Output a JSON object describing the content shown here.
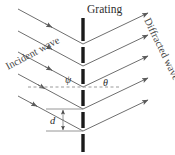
{
  "figure": {
    "name": "diffraction-grating-diagram",
    "width": 175,
    "height": 155,
    "background": "#ffffff"
  },
  "labels": {
    "grating": "Grating",
    "incident_wave": "Incident wave",
    "diffracted_wave": "Diffracted wave",
    "angle_incident": "ψ",
    "angle_diffracted": "θ",
    "spacing": "d"
  },
  "colors": {
    "grating_bar": "#1a1a1a",
    "ray": "#6f6f6f",
    "arrowhead": "#5a5a5a",
    "dashed_line": "#9a9a9a",
    "dimension_line": "#8a8a8a",
    "text": "#3a3a3a"
  },
  "geometry": {
    "grating_x": 83,
    "slit_nodes_y": [
      44,
      66,
      87,
      109,
      131
    ],
    "grating_bars": [
      {
        "y1": 18,
        "y2": 41
      },
      {
        "y1": 47,
        "y2": 63
      },
      {
        "y1": 69,
        "y2": 84
      },
      {
        "y1": 90,
        "y2": 106
      },
      {
        "y1": 112,
        "y2": 128
      },
      {
        "y1": 134,
        "y2": 152
      }
    ],
    "incident_rays": [
      {
        "x1": 18,
        "y1": 9,
        "x2": 83,
        "y2": 44,
        "head_t": 0.52
      },
      {
        "x1": 18,
        "y1": 31,
        "x2": 83,
        "y2": 66,
        "head_t": 0.52
      },
      {
        "x1": 18,
        "y1": 52,
        "x2": 83,
        "y2": 87,
        "head_t": 0.52
      },
      {
        "x1": 18,
        "y1": 74,
        "x2": 83,
        "y2": 109,
        "head_t": 0.52
      },
      {
        "x1": 18,
        "y1": 96,
        "x2": 83,
        "y2": 131,
        "head_t": 0.52
      }
    ],
    "diffracted_rays": [
      {
        "x1": 83,
        "y1": 44,
        "x2": 150,
        "y2": 12,
        "head_t": 1.0
      },
      {
        "x1": 83,
        "y1": 66,
        "x2": 150,
        "y2": 34,
        "head_t": 1.0
      },
      {
        "x1": 83,
        "y1": 87,
        "x2": 150,
        "y2": 55,
        "head_t": 1.0
      },
      {
        "x1": 83,
        "y1": 109,
        "x2": 150,
        "y2": 77,
        "head_t": 1.0
      },
      {
        "x1": 83,
        "y1": 131,
        "x2": 150,
        "y2": 99,
        "head_t": 1.0
      }
    ],
    "dashed_reference_line": {
      "x1": 28,
      "y1": 87,
      "x2": 120,
      "y2": 87
    },
    "dimension": {
      "upper_line": {
        "x1": 46,
        "y1": 109,
        "x2": 83,
        "y2": 109
      },
      "lower_line": {
        "x1": 46,
        "y1": 131,
        "x2": 83,
        "y2": 131
      },
      "arrow_x": 63,
      "arrow_top_y": 109,
      "arrow_bottom_y": 131
    },
    "label_positions": {
      "grating": {
        "x": 87,
        "y": 13
      },
      "incident_wave": {
        "x": 10,
        "y": 66,
        "rotation": -28
      },
      "diffracted_wave": {
        "x": 146,
        "y": 22,
        "rotation": 64
      },
      "angle_incident": {
        "x": 67,
        "y": 83
      },
      "angle_diffracted": {
        "x": 104,
        "y": 86
      },
      "spacing": {
        "x": 51,
        "y": 124
      }
    }
  }
}
